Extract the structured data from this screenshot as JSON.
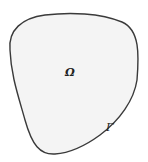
{
  "diagram": {
    "type": "domain-with-boundary",
    "region": {
      "label": "Ω",
      "fill": "#f4f4f4",
      "label_position": [
        68,
        76
      ]
    },
    "boundary": {
      "label": "Γ",
      "stroke": "#3a3a3a",
      "label_position": [
        106,
        130
      ]
    },
    "colors": {
      "background": "#ffffff",
      "fill": "#f4f4f4",
      "outline": "#3a3a3a",
      "text": "#222222"
    }
  }
}
